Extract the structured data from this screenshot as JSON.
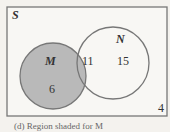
{
  "diagram": {
    "type": "venn",
    "universe_label": "S",
    "sets": [
      {
        "label": "M",
        "only_count": "6",
        "shaded": true
      },
      {
        "label": "N",
        "only_count": "15",
        "shaded": false
      }
    ],
    "intersection_count": "11",
    "outside_count": "4",
    "colors": {
      "shade": "#b9b9b9",
      "stroke": "#777777",
      "background": "#f4f2ee"
    },
    "caption": "(d) Region shaded for M"
  }
}
